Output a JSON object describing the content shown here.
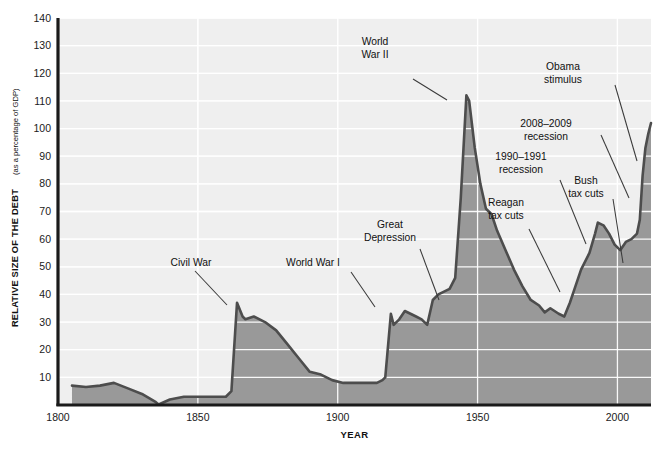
{
  "chart_data": {
    "type": "area",
    "title": "",
    "xlabel": "YEAR",
    "ylabel_main": "RELATIVE SIZE OF THE DEBT",
    "ylabel_sub": "(as a percentage of GDP)",
    "xlim": [
      1800,
      2012
    ],
    "ylim": [
      0,
      140
    ],
    "xticks": [
      1800,
      1850,
      1900,
      1950,
      2000
    ],
    "xtick_labels": [
      "1800",
      "1850",
      "1900",
      "1950",
      "2000"
    ],
    "yticks": [
      10,
      20,
      30,
      40,
      50,
      60,
      70,
      80,
      90,
      100,
      110,
      120,
      130,
      140
    ],
    "ytick_labels": [
      "10",
      "20",
      "30",
      "40",
      "50",
      "60",
      "70",
      "80",
      "90",
      "100",
      "110",
      "120",
      "130",
      "140"
    ],
    "grid": "horizontal-white-and-vertical-white",
    "legend": "none",
    "series_name": "Federal debt held by the public as a percentage of GDP",
    "fill_color": "#999999",
    "line_color": "#4d4d4d",
    "plot_background": "#efefef",
    "gridline_color": "#ffffff",
    "x": [
      1805,
      1810,
      1815,
      1820,
      1825,
      1830,
      1835,
      1836,
      1840,
      1845,
      1850,
      1855,
      1860,
      1862,
      1864,
      1866,
      1867,
      1870,
      1874,
      1878,
      1882,
      1886,
      1890,
      1894,
      1898,
      1902,
      1906,
      1910,
      1914,
      1916,
      1917,
      1919,
      1920,
      1922,
      1924,
      1926,
      1928,
      1930,
      1932,
      1934,
      1936,
      1938,
      1940,
      1942,
      1944,
      1946,
      1947,
      1949,
      1951,
      1953,
      1955,
      1957,
      1960,
      1963,
      1966,
      1969,
      1972,
      1974,
      1976,
      1979,
      1981,
      1983,
      1985,
      1987,
      1990,
      1992,
      1993,
      1995,
      1997,
      1999,
      2001,
      2003,
      2005,
      2007,
      2008,
      2009,
      2010,
      2011,
      2012
    ],
    "y": [
      7,
      6.5,
      7,
      8,
      6,
      4,
      1,
      0.2,
      2,
      3,
      3,
      3,
      3,
      5,
      37,
      32,
      31,
      32,
      30,
      27,
      22,
      17,
      12,
      11,
      9,
      8,
      8,
      8,
      8,
      9,
      10,
      33,
      29,
      31,
      34,
      33,
      32,
      31,
      29,
      38,
      40,
      41,
      42,
      46,
      75,
      112,
      110,
      93,
      80,
      71,
      69,
      63,
      56,
      49,
      43,
      38,
      36,
      33.5,
      35,
      33,
      32,
      37,
      43,
      49,
      55,
      62,
      66,
      65,
      62,
      58,
      56,
      59,
      60,
      62,
      67,
      83,
      93,
      98,
      102
    ],
    "annotations": [
      {
        "label": "Civil War",
        "text_x": 191,
        "text_y": 266,
        "leader": "M195,271 L227,305"
      },
      {
        "label": "World War I",
        "text_x": 313,
        "text_y": 266,
        "leader": "M351,272 L375,307"
      },
      {
        "label": "Great\nDepression",
        "lines": [
          "Great",
          "Depression"
        ],
        "text_x": 390,
        "text_y": 228,
        "leader": "M420,249 L439,300"
      },
      {
        "label": "World\nWar II",
        "lines": [
          "World",
          "War II"
        ],
        "text_x": 375,
        "text_y": 45,
        "leader": "M413,79 L447,100"
      },
      {
        "label": "Reagan\ntax cuts",
        "lines": [
          "Reagan",
          "tax cuts"
        ],
        "text_x": 506,
        "text_y": 206,
        "leader": "M529,229 L560,292"
      },
      {
        "label": "1990–1991\nrecession",
        "lines": [
          "1990–1991",
          "recession"
        ],
        "text_x": 521,
        "text_y": 160,
        "leader": "M560,180 L586,244"
      },
      {
        "label": "Bush\ntax cuts",
        "lines": [
          "Bush",
          "tax cuts"
        ],
        "text_x": 586,
        "text_y": 184,
        "leader": "M613,199 L623,263"
      },
      {
        "label": "2008–2009\nrecession",
        "lines": [
          "2008–2009",
          "recession"
        ],
        "text_x": 546,
        "text_y": 127,
        "leader": "M601,135 L629,198"
      },
      {
        "label": "Obama\nstimulus",
        "lines": [
          "Obama",
          "stimulus"
        ],
        "text_x": 563,
        "text_y": 70,
        "leader": "M615,85 L637,161"
      }
    ]
  }
}
